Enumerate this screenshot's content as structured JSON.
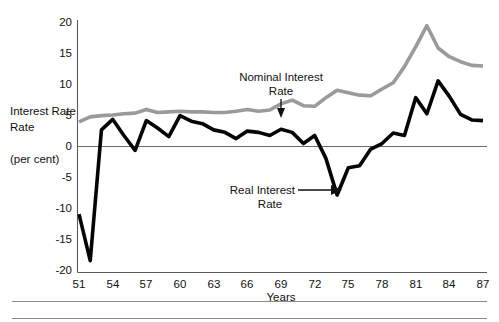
{
  "chart_data": {
    "type": "line",
    "title": "",
    "xlabel": "Years",
    "ylabel": "Interest Rate",
    "ylabel_units": "(per cent)",
    "xlim": [
      51,
      87
    ],
    "ylim": [
      -20,
      20
    ],
    "grid": false,
    "zero_line": true,
    "legend_position": "inline-annotations",
    "x": [
      51,
      52,
      53,
      54,
      55,
      56,
      57,
      58,
      59,
      60,
      61,
      62,
      63,
      64,
      65,
      66,
      67,
      68,
      69,
      70,
      71,
      72,
      73,
      74,
      75,
      76,
      77,
      78,
      79,
      80,
      81,
      82,
      83,
      84,
      85,
      86,
      87
    ],
    "xticks": [
      51,
      54,
      57,
      60,
      63,
      66,
      69,
      72,
      75,
      78,
      81,
      84,
      87
    ],
    "xtick_labels": [
      "51",
      "54",
      "57",
      "60",
      "63",
      "66",
      "69",
      "72",
      "75",
      "78",
      "81",
      "84",
      "87"
    ],
    "yticks": [
      20,
      15,
      10,
      5,
      0,
      -5,
      -10,
      -15,
      -20
    ],
    "ytick_labels": [
      "20",
      "15",
      "10",
      "5",
      "0",
      "-5",
      "-10",
      "-15",
      "-20"
    ],
    "series": [
      {
        "name": "Nominal Interest Rate",
        "color": "#9a9a9a",
        "values": [
          3.9,
          4.7,
          4.9,
          5.0,
          5.2,
          5.3,
          5.9,
          5.4,
          5.5,
          5.6,
          5.5,
          5.5,
          5.4,
          5.4,
          5.6,
          5.9,
          5.6,
          5.8,
          6.8,
          7.4,
          6.5,
          6.4,
          7.8,
          9.0,
          8.6,
          8.2,
          8.1,
          9.2,
          10.2,
          12.8,
          16.0,
          19.4,
          15.8,
          14.4,
          13.6,
          13.0,
          12.9
        ]
      },
      {
        "name": "Real Interest Rate",
        "color": "#050505",
        "values": [
          -11.0,
          -18.5,
          2.6,
          4.3,
          1.7,
          -0.7,
          4.1,
          2.9,
          1.5,
          4.9,
          4.0,
          3.6,
          2.6,
          2.2,
          1.2,
          2.4,
          2.2,
          1.7,
          2.7,
          2.2,
          0.4,
          1.7,
          -2.0,
          -7.9,
          -3.5,
          -3.2,
          -0.5,
          0.4,
          2.1,
          1.7,
          7.8,
          5.2,
          10.5,
          8.0,
          5.1,
          4.2,
          4.1
        ]
      }
    ],
    "annotations": [
      {
        "id": "nominal-annotation",
        "line1": "Nominal Interest",
        "line2": "Rate",
        "points_to_series": "Nominal Interest Rate",
        "arrow_direction": "down"
      },
      {
        "id": "real-annotation",
        "line1": "Real Interest",
        "line2": "Rate",
        "points_to_series": "Real Interest Rate",
        "arrow_direction": "right"
      }
    ]
  }
}
